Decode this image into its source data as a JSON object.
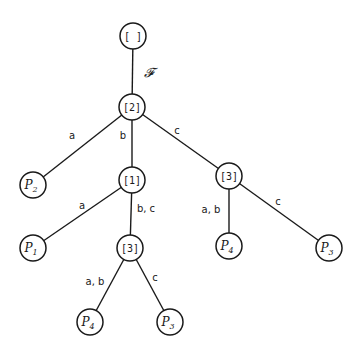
{
  "diagram": {
    "type": "tree",
    "nodes": [
      {
        "id": "root",
        "label": "[ ]",
        "kind": "internal",
        "x": 133,
        "y": 36
      },
      {
        "id": "n2",
        "label": "[2]",
        "kind": "internal",
        "x": 132,
        "y": 107
      },
      {
        "id": "p2",
        "label": "P",
        "sub": "2",
        "kind": "leaf",
        "x": 33,
        "y": 185
      },
      {
        "id": "n1",
        "label": "[1]",
        "kind": "internal",
        "x": 132,
        "y": 180
      },
      {
        "id": "n3r",
        "label": "[3]",
        "kind": "internal",
        "x": 229,
        "y": 176
      },
      {
        "id": "p1",
        "label": "P",
        "sub": "1",
        "kind": "leaf",
        "x": 33,
        "y": 248
      },
      {
        "id": "n3l",
        "label": "[3]",
        "kind": "internal",
        "x": 130,
        "y": 248
      },
      {
        "id": "p4r",
        "label": "P",
        "sub": "4",
        "kind": "leaf",
        "x": 229,
        "y": 246
      },
      {
        "id": "p3r",
        "label": "P",
        "sub": "3",
        "kind": "leaf",
        "x": 329,
        "y": 248
      },
      {
        "id": "p4l",
        "label": "P",
        "sub": "4",
        "kind": "leaf",
        "x": 90,
        "y": 322
      },
      {
        "id": "p3l",
        "label": "P",
        "sub": "3",
        "kind": "leaf",
        "x": 170,
        "y": 322
      }
    ],
    "edges": [
      {
        "from": "root",
        "to": "n2",
        "label": "𝓕",
        "lx": 149,
        "ly": 72,
        "script": true
      },
      {
        "from": "n2",
        "to": "p2",
        "label": "a",
        "lx": 72,
        "ly": 135
      },
      {
        "from": "n2",
        "to": "n1",
        "label": "b",
        "lx": 123,
        "ly": 135
      },
      {
        "from": "n2",
        "to": "n3r",
        "label": "c",
        "lx": 177,
        "ly": 130
      },
      {
        "from": "n1",
        "to": "p1",
        "label": "a",
        "lx": 82,
        "ly": 205
      },
      {
        "from": "n1",
        "to": "n3l",
        "label": "b, c",
        "lx": 146,
        "ly": 208
      },
      {
        "from": "n3l",
        "to": "p4l",
        "label": "a, b",
        "lx": 95,
        "ly": 281
      },
      {
        "from": "n3l",
        "to": "p3l",
        "label": "c",
        "lx": 155,
        "ly": 277
      },
      {
        "from": "n3r",
        "to": "p4r",
        "label": "a, b",
        "lx": 211,
        "ly": 209
      },
      {
        "from": "n3r",
        "to": "p3r",
        "label": "c",
        "lx": 278,
        "ly": 201
      }
    ],
    "node_radius": 13,
    "stroke_color": "#1a1a1a",
    "background": "#ffffff"
  }
}
